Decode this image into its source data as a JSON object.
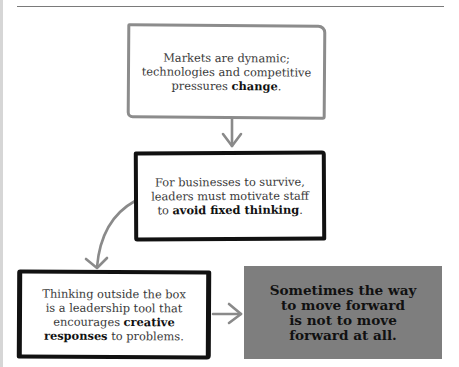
{
  "colors": {
    "background": "#ffffff",
    "rule": "#7a7a7a",
    "box1_border": "#8c8c8c",
    "box_dark_border": "#111111",
    "highlight_box": "#7e7e7e",
    "arrow": "#8a8a8a"
  },
  "diagram": {
    "box1": {
      "line1": "Markets are dynamic;",
      "line2": "technologies and competitive",
      "line3_pre": "pressures ",
      "line3_bold": "change",
      "line3_post": "."
    },
    "box2": {
      "line1": "For businesses to survive,",
      "line2": "leaders must motivate staff",
      "line3_pre": "to ",
      "line3_bold": "avoid fixed thinking",
      "line3_post": "."
    },
    "box3": {
      "line1": "Thinking outside the box",
      "line2": "is a leadership tool that",
      "line3_pre": "encourages ",
      "line3_bold": "creative",
      "line4_bold": "responses",
      "line4_post": " to problems."
    },
    "box4": {
      "line1": "Sometimes the way",
      "line2": "to move forward",
      "line3": "is not to move",
      "line4": "forward at all."
    },
    "arrows": [
      {
        "from": "box1",
        "to": "box2",
        "direction": "down"
      },
      {
        "from": "box2",
        "to": "box3",
        "direction": "curved-down-left"
      },
      {
        "from": "box3",
        "to": "box4",
        "direction": "right"
      }
    ]
  }
}
